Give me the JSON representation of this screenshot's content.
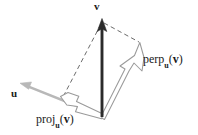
{
  "figure": {
    "background_color": "#ffffff",
    "width": 198,
    "height": 135,
    "colors": {
      "vector_v": "#2b2b2b",
      "vector_u": "#b4b4b4",
      "hollow_arrow_outline": "#909090",
      "dashed_guide": "#555555",
      "label_text": "#1a1a1a"
    },
    "labels": {
      "v": "v",
      "u": "u",
      "perp_name": "perp",
      "perp_subscript": "u",
      "perp_open_paren": "(",
      "perp_arg": "v",
      "perp_close_paren": ")",
      "proj_name": "proj",
      "proj_subscript": "u",
      "proj_open_paren": "(",
      "proj_arg": "v",
      "proj_close_paren": ")"
    },
    "vectors": [
      {
        "name": "v",
        "style": "solid-thick-dark",
        "from": [
          102,
          116
        ],
        "to": [
          102,
          21
        ],
        "label": "v"
      },
      {
        "name": "u",
        "style": "solid-gray",
        "from": [
          102,
          116
        ],
        "to": [
          22,
          84
        ],
        "label": "u"
      },
      {
        "name": "proj_u(v)",
        "style": "hollow-outline",
        "from": [
          102,
          116
        ],
        "to": [
          62,
          96
        ],
        "label": "proj_u(v)"
      },
      {
        "name": "perp_u(v)",
        "style": "hollow-outline",
        "from": [
          102,
          116
        ],
        "to": [
          140,
          43
        ],
        "label": "perp_u(v)"
      }
    ],
    "guides": [
      {
        "name": "dashed-v-to-proj-tip",
        "style": "dashed",
        "from": [
          102,
          22
        ],
        "to": [
          63,
          97
        ]
      },
      {
        "name": "dashed-v-to-perp-tip",
        "style": "dashed",
        "from": [
          103,
          22
        ],
        "to": [
          141,
          44
        ]
      }
    ]
  }
}
